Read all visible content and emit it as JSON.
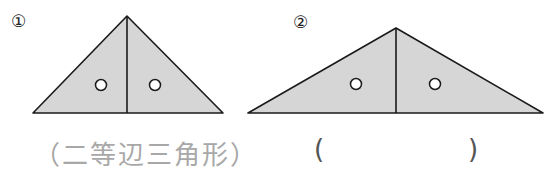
{
  "figures": [
    {
      "number": "①",
      "answer": "（二等辺三角形）",
      "fill": "#d6d6d6",
      "apex": [
        127,
        16
      ],
      "base_left": [
        33,
        113
      ],
      "base_right": [
        223,
        113
      ],
      "marks": [
        [
          101,
          85
        ],
        [
          155,
          85
        ]
      ]
    },
    {
      "number": "②",
      "answer_open": "(",
      "answer_close": ")",
      "fill": "#d6d6d6",
      "apex": [
        396,
        28
      ],
      "base_left": [
        248,
        113
      ],
      "base_right": [
        543,
        113
      ],
      "marks": [
        [
          356,
          84
        ],
        [
          435,
          84
        ]
      ]
    }
  ]
}
